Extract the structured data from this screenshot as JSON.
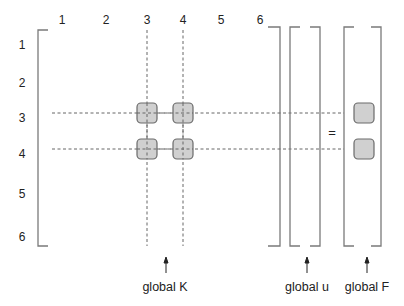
{
  "column_labels": [
    "1",
    "2",
    "3",
    "4",
    "5",
    "6"
  ],
  "row_labels": [
    "1",
    "2",
    "3",
    "4",
    "5",
    "6"
  ],
  "equals_sign": "=",
  "captions": {
    "global_K": "global K",
    "global_u": "global u",
    "global_F": "global F"
  },
  "highlighted_entries": {
    "K": [
      [
        3,
        3
      ],
      [
        3,
        4
      ],
      [
        4,
        3
      ],
      [
        4,
        4
      ]
    ],
    "F": [
      3,
      4
    ]
  },
  "colors": {
    "box_fill": "#d0d0d0",
    "box_stroke": "#6a6a6a",
    "line": "#7a7a7a",
    "text": "#222222"
  }
}
